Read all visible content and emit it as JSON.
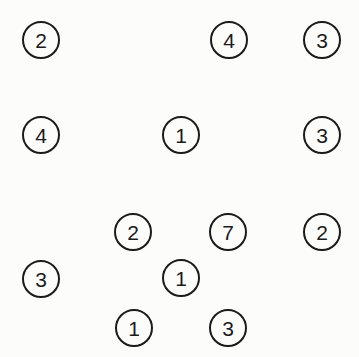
{
  "canvas": {
    "width": 359,
    "height": 357,
    "background_color": "#fcfcfb",
    "stroke_color": "#1b1b1b",
    "text_color": "#1b1b1b"
  },
  "diagram": {
    "type": "numbered-circle-scatter",
    "node_count": 14,
    "node_radius": 19,
    "nodes": [
      {
        "id": "node-1",
        "label": "2",
        "cx": 41,
        "cy": 40,
        "r": 19
      },
      {
        "id": "node-2",
        "label": "4",
        "cx": 229,
        "cy": 40,
        "r": 19
      },
      {
        "id": "node-3",
        "label": "3",
        "cx": 322,
        "cy": 40,
        "r": 19
      },
      {
        "id": "node-4",
        "label": "4",
        "cx": 41,
        "cy": 135,
        "r": 19
      },
      {
        "id": "node-5",
        "label": "1",
        "cx": 181,
        "cy": 135,
        "r": 19
      },
      {
        "id": "node-6",
        "label": "3",
        "cx": 322,
        "cy": 135,
        "r": 19
      },
      {
        "id": "node-7",
        "label": "2",
        "cx": 133,
        "cy": 232,
        "r": 19
      },
      {
        "id": "node-8",
        "label": "7",
        "cx": 228,
        "cy": 232,
        "r": 19
      },
      {
        "id": "node-9",
        "label": "2",
        "cx": 322,
        "cy": 232,
        "r": 19
      },
      {
        "id": "node-10",
        "label": "3",
        "cx": 41,
        "cy": 279,
        "r": 19
      },
      {
        "id": "node-11",
        "label": "1",
        "cx": 181,
        "cy": 278,
        "r": 19
      },
      {
        "id": "node-12",
        "label": "1",
        "cx": 134,
        "cy": 328,
        "r": 19
      },
      {
        "id": "node-13",
        "label": "3",
        "cx": 228,
        "cy": 328,
        "r": 19
      }
    ],
    "extra_nodes": [
      {
        "id": "node-14",
        "label": "3",
        "cx": 322,
        "cy": 40,
        "r": 19,
        "duplicate_of": "node-3"
      }
    ]
  }
}
